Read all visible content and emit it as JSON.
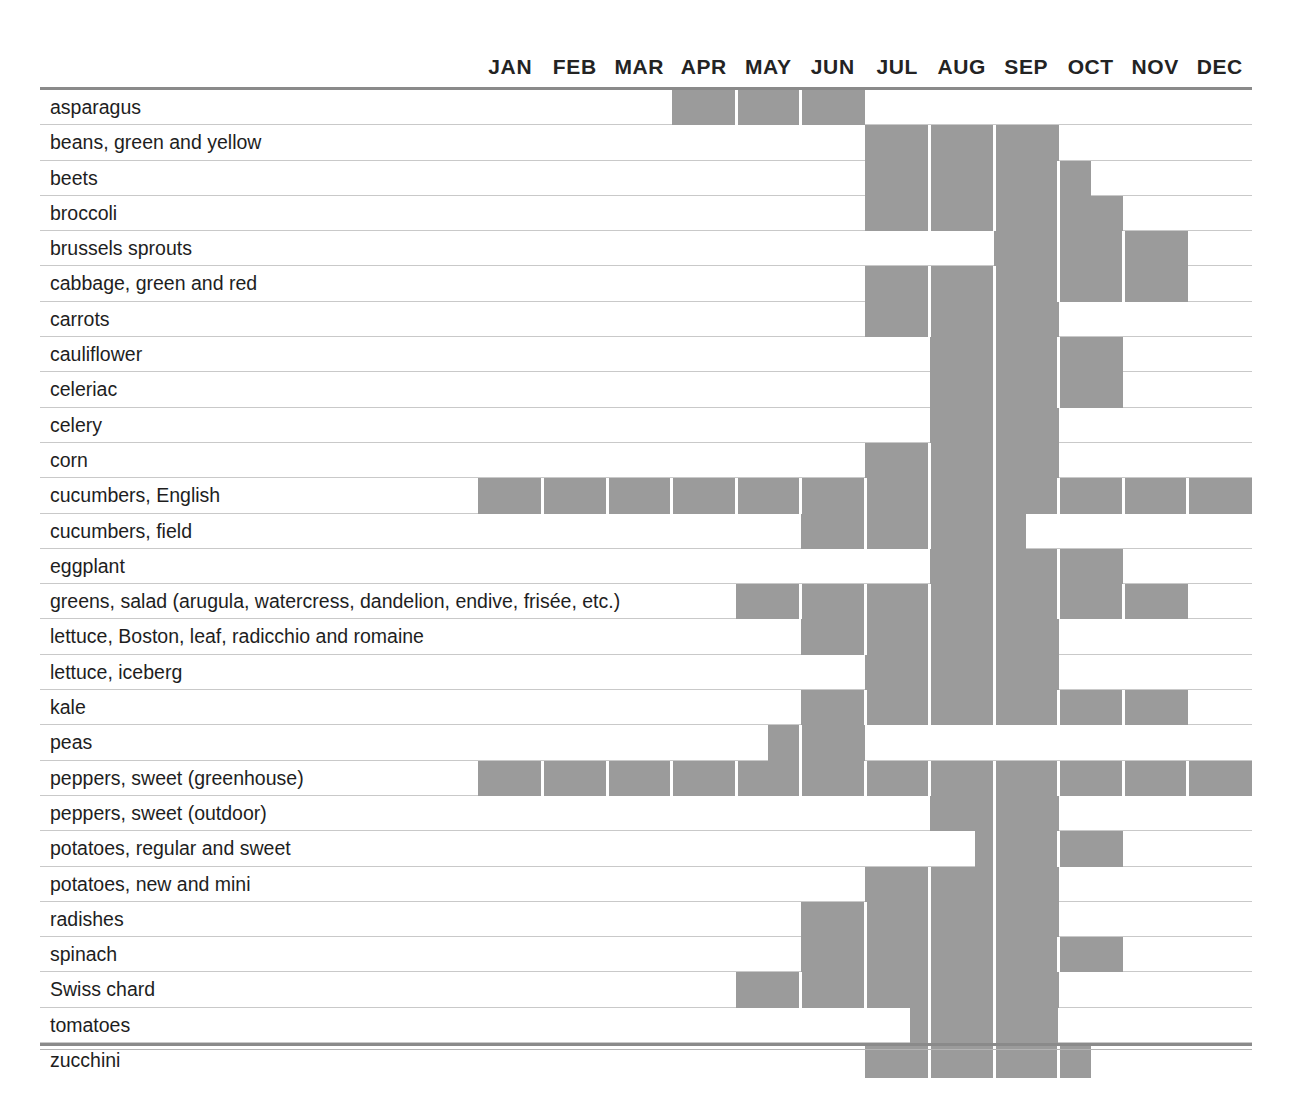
{
  "colors": {
    "bar_fill": "#9b9b9b",
    "rule": "#8a8a8a",
    "row_line": "#c9c9c9",
    "text": "#1e1e1e",
    "background": "#ffffff"
  },
  "months": [
    "JAN",
    "FEB",
    "MAR",
    "APR",
    "MAY",
    "JUN",
    "JUL",
    "AUG",
    "SEP",
    "OCT",
    "NOV",
    "DEC"
  ],
  "chart_data": {
    "type": "heatmap",
    "xlabel": "",
    "ylabel": "",
    "categories": [
      "JAN",
      "FEB",
      "MAR",
      "APR",
      "MAY",
      "JUN",
      "JUL",
      "AUG",
      "SEP",
      "OCT",
      "NOV",
      "DEC"
    ],
    "legend": [],
    "grid": true,
    "note": "Each row is a vegetable; shaded month-cells mark local availability. start/end are in month units where 0.0 = start of JAN and 12.0 = end of DEC; half values indicate the bar begins or ends mid-month.",
    "rows": [
      {
        "label": "asparagus",
        "spans": [
          {
            "start": 3.0,
            "end": 6.0
          }
        ],
        "months": [
          "APR",
          "MAY",
          "JUN"
        ]
      },
      {
        "label": "beans, green and yellow",
        "spans": [
          {
            "start": 6.0,
            "end": 9.0
          }
        ],
        "months": [
          "JUL",
          "AUG",
          "SEP"
        ]
      },
      {
        "label": "beets",
        "spans": [
          {
            "start": 6.0,
            "end": 9.5
          }
        ],
        "months": [
          "JUL",
          "AUG",
          "SEP",
          "OCT"
        ]
      },
      {
        "label": "broccoli",
        "spans": [
          {
            "start": 6.0,
            "end": 10.0
          }
        ],
        "months": [
          "JUL",
          "AUG",
          "SEP",
          "OCT"
        ]
      },
      {
        "label": "brussels sprouts",
        "spans": [
          {
            "start": 8.0,
            "end": 11.0
          }
        ],
        "months": [
          "SEP",
          "OCT",
          "NOV"
        ]
      },
      {
        "label": "cabbage, green and red",
        "spans": [
          {
            "start": 6.0,
            "end": 11.0
          }
        ],
        "months": [
          "JUL",
          "AUG",
          "SEP",
          "OCT",
          "NOV"
        ]
      },
      {
        "label": "carrots",
        "spans": [
          {
            "start": 6.0,
            "end": 9.0
          }
        ],
        "months": [
          "JUL",
          "AUG",
          "SEP"
        ]
      },
      {
        "label": "cauliflower",
        "spans": [
          {
            "start": 7.0,
            "end": 10.0
          }
        ],
        "months": [
          "AUG",
          "SEP",
          "OCT"
        ]
      },
      {
        "label": "celeriac",
        "spans": [
          {
            "start": 7.0,
            "end": 10.0
          }
        ],
        "months": [
          "AUG",
          "SEP",
          "OCT"
        ]
      },
      {
        "label": "celery",
        "spans": [
          {
            "start": 7.0,
            "end": 9.0
          }
        ],
        "months": [
          "AUG",
          "SEP"
        ]
      },
      {
        "label": "corn",
        "spans": [
          {
            "start": 6.0,
            "end": 9.0
          }
        ],
        "months": [
          "JUL",
          "AUG",
          "SEP"
        ]
      },
      {
        "label": "cucumbers, English",
        "spans": [
          {
            "start": 0.0,
            "end": 12.0
          }
        ],
        "months": [
          "JAN",
          "FEB",
          "MAR",
          "APR",
          "MAY",
          "JUN",
          "JUL",
          "AUG",
          "SEP",
          "OCT",
          "NOV",
          "DEC"
        ]
      },
      {
        "label": "cucumbers, field",
        "spans": [
          {
            "start": 5.0,
            "end": 8.5
          }
        ],
        "months": [
          "JUN",
          "JUL",
          "AUG",
          "SEP"
        ]
      },
      {
        "label": "eggplant",
        "spans": [
          {
            "start": 7.0,
            "end": 10.0
          }
        ],
        "months": [
          "AUG",
          "SEP",
          "OCT"
        ]
      },
      {
        "label": "greens, salad (arugula, watercress, dandelion, endive, frisée, etc.)",
        "spans": [
          {
            "start": 4.0,
            "end": 11.0
          }
        ],
        "months": [
          "MAY",
          "JUN",
          "JUL",
          "AUG",
          "SEP",
          "OCT",
          "NOV"
        ]
      },
      {
        "label": "lettuce, Boston, leaf, radicchio and romaine",
        "spans": [
          {
            "start": 5.0,
            "end": 9.0
          }
        ],
        "months": [
          "JUN",
          "JUL",
          "AUG",
          "SEP"
        ]
      },
      {
        "label": "lettuce, iceberg",
        "spans": [
          {
            "start": 6.0,
            "end": 9.0
          }
        ],
        "months": [
          "JUL",
          "AUG",
          "SEP"
        ]
      },
      {
        "label": "kale",
        "spans": [
          {
            "start": 5.0,
            "end": 11.0
          }
        ],
        "months": [
          "JUN",
          "JUL",
          "AUG",
          "SEP",
          "OCT",
          "NOV"
        ]
      },
      {
        "label": "peas",
        "spans": [
          {
            "start": 4.5,
            "end": 6.0
          }
        ],
        "months": [
          "JUN"
        ]
      },
      {
        "label": "peppers, sweet (greenhouse)",
        "spans": [
          {
            "start": 0.0,
            "end": 12.0
          }
        ],
        "months": [
          "JAN",
          "FEB",
          "MAR",
          "APR",
          "MAY",
          "JUN",
          "JUL",
          "AUG",
          "SEP",
          "OCT",
          "NOV",
          "DEC"
        ]
      },
      {
        "label": "peppers, sweet (outdoor)",
        "spans": [
          {
            "start": 7.0,
            "end": 9.0
          }
        ],
        "months": [
          "AUG",
          "SEP"
        ]
      },
      {
        "label": "potatoes, regular and sweet",
        "spans": [
          {
            "start": 7.7,
            "end": 10.0
          }
        ],
        "months": [
          "SEP",
          "OCT"
        ]
      },
      {
        "label": "potatoes, new and mini",
        "spans": [
          {
            "start": 6.0,
            "end": 9.0
          }
        ],
        "months": [
          "JUL",
          "AUG",
          "SEP"
        ]
      },
      {
        "label": "radishes",
        "spans": [
          {
            "start": 5.0,
            "end": 9.0
          }
        ],
        "months": [
          "JUN",
          "JUL",
          "AUG",
          "SEP"
        ]
      },
      {
        "label": "spinach",
        "spans": [
          {
            "start": 5.0,
            "end": 10.0
          }
        ],
        "months": [
          "JUN",
          "JUL",
          "AUG",
          "SEP",
          "OCT"
        ]
      },
      {
        "label": "Swiss chard",
        "spans": [
          {
            "start": 4.0,
            "end": 9.0
          }
        ],
        "months": [
          "MAY",
          "JUN",
          "JUL",
          "AUG",
          "SEP"
        ]
      },
      {
        "label": "tomatoes",
        "spans": [
          {
            "start": 6.7,
            "end": 9.0
          }
        ],
        "months": [
          "AUG",
          "SEP"
        ]
      },
      {
        "label": "zucchini",
        "spans": [
          {
            "start": 6.0,
            "end": 9.5
          }
        ],
        "months": [
          "JUL",
          "AUG",
          "SEP",
          "OCT"
        ]
      }
    ]
  }
}
